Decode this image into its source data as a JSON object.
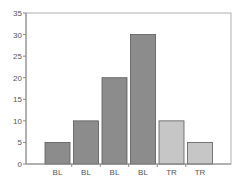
{
  "chart_data": {
    "type": "bar",
    "title": "",
    "xlabel": "",
    "ylabel": "",
    "categories": [
      "BL",
      "BL",
      "BL",
      "BL",
      "TR",
      "TR"
    ],
    "values": [
      5,
      10,
      20,
      30,
      10,
      5
    ],
    "groups": [
      "BL",
      "BL",
      "BL",
      "BL",
      "TR",
      "TR"
    ],
    "ylim": [
      0,
      35
    ],
    "yticks": [
      0,
      5,
      10,
      15,
      20,
      25,
      30,
      35
    ],
    "grid": false,
    "legend": null
  },
  "colors": {
    "BL": "#8c8c8c",
    "TR": "#c6c6c6",
    "bar_border": "#5a5a5a",
    "axis": "#8a8a8a",
    "frame": "#b0b0b0"
  }
}
